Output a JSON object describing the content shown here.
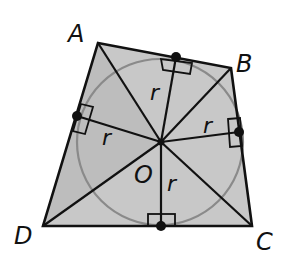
{
  "figure": {
    "vertices": {
      "A": {
        "label": "A",
        "x": 98,
        "y": 43,
        "lx": 68,
        "ly": 42
      },
      "B": {
        "label": "B",
        "x": 231,
        "y": 68,
        "lx": 236,
        "ly": 72
      },
      "C": {
        "label": "C",
        "x": 252,
        "y": 226,
        "lx": 256,
        "ly": 250
      },
      "D": {
        "label": "D",
        "x": 43,
        "y": 226,
        "lx": 14,
        "ly": 244
      }
    },
    "center": {
      "label": "O",
      "x": 161,
      "y": 142,
      "lx": 134,
      "ly": 183
    },
    "radius_label": "r",
    "tangent_points": [
      {
        "side": "AB",
        "x": 176,
        "y": 57
      },
      {
        "side": "BC",
        "x": 239,
        "y": 132
      },
      {
        "side": "CD",
        "x": 161,
        "y": 226
      },
      {
        "side": "DA",
        "x": 77,
        "y": 116
      }
    ],
    "radius_labels": [
      {
        "text": "r",
        "x": 150,
        "y": 100
      },
      {
        "text": "r",
        "x": 203,
        "y": 133
      },
      {
        "text": "r",
        "x": 102,
        "y": 145
      },
      {
        "text": "r",
        "x": 167,
        "y": 191
      }
    ],
    "colors": {
      "fill": "#c8c8c8",
      "circle": "#8a8a8a",
      "stroke": "#111111"
    }
  }
}
